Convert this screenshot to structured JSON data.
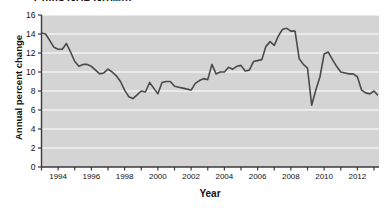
{
  "chart_data": {
    "type": "line",
    "title": "China GDP Growth",
    "xlabel": "Year",
    "ylabel": "Annual percent change",
    "xlim": [
      1993.0,
      2013.3
    ],
    "ylim": [
      0,
      16
    ],
    "ytick_labels": [
      "0",
      "2",
      "4",
      "6",
      "8",
      "10",
      "12",
      "14",
      "16"
    ],
    "yticks": [
      0,
      2,
      4,
      6,
      8,
      10,
      12,
      14,
      16
    ],
    "xtick_labels": [
      "1994",
      "1996",
      "1998",
      "2000",
      "2002",
      "2004",
      "2006",
      "2008",
      "2010",
      "2012"
    ],
    "xticks": [
      1994,
      1996,
      1998,
      2000,
      2002,
      2004,
      2006,
      2008,
      2010,
      2012
    ],
    "xminor_ticks": [
      1993,
      1995,
      1997,
      1999,
      2001,
      2003,
      2005,
      2007,
      2009,
      2011,
      2013
    ],
    "grid": "horizontal",
    "legend": "none",
    "plot_bgcolor": "#d4d4d4",
    "grid_color": "#ffffff",
    "line_color": "#4a4a4a",
    "axis_color": "#3a3a3a",
    "series": [
      {
        "name": "China GDP growth",
        "x": [
          1993.0,
          1993.25,
          1993.5,
          1993.75,
          1994.0,
          1994.25,
          1994.5,
          1994.75,
          1995.0,
          1995.25,
          1995.5,
          1995.75,
          1996.0,
          1996.25,
          1996.5,
          1996.75,
          1997.0,
          1997.25,
          1997.5,
          1997.75,
          1998.0,
          1998.25,
          1998.5,
          1998.75,
          1999.0,
          1999.25,
          1999.5,
          1999.75,
          2000.0,
          2000.25,
          2000.5,
          2000.75,
          2001.0,
          2001.25,
          2001.5,
          2001.75,
          2002.0,
          2002.25,
          2002.5,
          2002.75,
          2003.0,
          2003.25,
          2003.5,
          2003.75,
          2004.0,
          2004.25,
          2004.5,
          2004.75,
          2005.0,
          2005.25,
          2005.5,
          2005.75,
          2006.0,
          2006.25,
          2006.5,
          2006.75,
          2007.0,
          2007.25,
          2007.5,
          2007.75,
          2008.0,
          2008.25,
          2008.5,
          2008.75,
          2009.0,
          2009.25,
          2009.5,
          2009.75,
          2010.0,
          2010.25,
          2010.5,
          2010.75,
          2011.0,
          2011.25,
          2011.5,
          2011.75,
          2012.0,
          2012.25,
          2012.5,
          2012.75,
          2013.0,
          2013.2
        ],
        "y": [
          14.1,
          14.0,
          13.3,
          12.6,
          12.4,
          12.4,
          13.0,
          12.1,
          11.1,
          10.6,
          10.8,
          10.8,
          10.6,
          10.2,
          9.8,
          9.9,
          10.3,
          10.0,
          9.6,
          9.0,
          8.1,
          7.4,
          7.2,
          7.6,
          8.0,
          7.9,
          8.9,
          8.3,
          7.7,
          8.9,
          9.0,
          9.0,
          8.5,
          8.4,
          8.3,
          8.2,
          8.1,
          8.8,
          9.1,
          9.3,
          9.2,
          10.8,
          9.8,
          10.0,
          10.0,
          10.5,
          10.3,
          10.6,
          10.7,
          10.1,
          10.2,
          11.1,
          11.2,
          11.3,
          12.7,
          13.2,
          12.8,
          13.8,
          14.5,
          14.6,
          14.3,
          14.3,
          11.4,
          10.8,
          10.4,
          6.5,
          8.1,
          9.5,
          11.9,
          12.1,
          11.3,
          10.6,
          10.0,
          9.9,
          9.8,
          9.8,
          9.5,
          8.1,
          7.8,
          7.7,
          8.0,
          7.6
        ]
      }
    ]
  }
}
